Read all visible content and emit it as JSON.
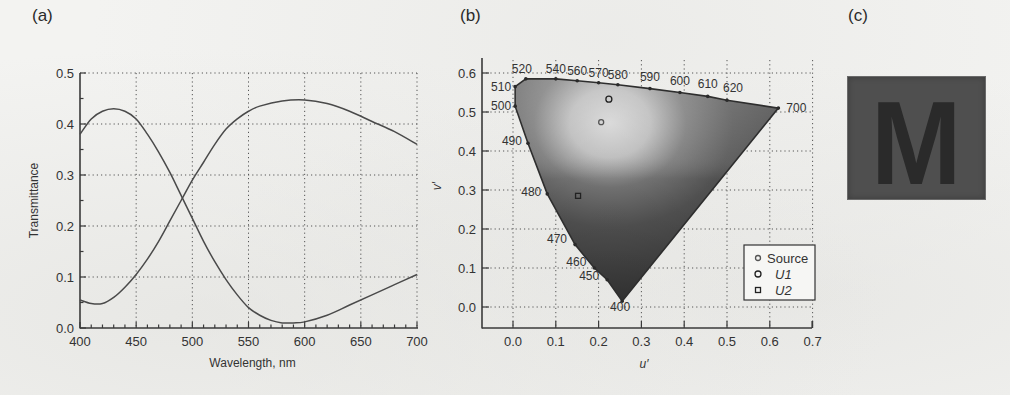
{
  "panels": {
    "a": {
      "label": "(a)"
    },
    "b": {
      "label": "(b)"
    },
    "c": {
      "label": "(c)",
      "letter": "M",
      "background_color": "#4f4f4f",
      "letter_color": "#2a2a2a"
    }
  },
  "chart_data": [
    {
      "id": "a",
      "type": "line",
      "title": "",
      "xlabel": "Wavelength, nm",
      "ylabel": "Transmittance",
      "xlim": [
        400,
        700
      ],
      "ylim": [
        0.0,
        0.5
      ],
      "xticks": [
        "400",
        "450",
        "500",
        "550",
        "600",
        "650",
        "700"
      ],
      "yticks": [
        "0.0",
        "0.1",
        "0.2",
        "0.3",
        "0.4",
        "0.5"
      ],
      "grid": true,
      "legend": null,
      "series": [
        {
          "name": "filter-1",
          "x": [
            400,
            410,
            420,
            430,
            440,
            450,
            460,
            470,
            480,
            490,
            500,
            510,
            520,
            530,
            540,
            550,
            560,
            570,
            580,
            590,
            600,
            620,
            640,
            660,
            680,
            700
          ],
          "values": [
            0.38,
            0.41,
            0.425,
            0.43,
            0.425,
            0.41,
            0.38,
            0.345,
            0.305,
            0.26,
            0.215,
            0.17,
            0.13,
            0.095,
            0.065,
            0.04,
            0.025,
            0.015,
            0.01,
            0.01,
            0.012,
            0.025,
            0.045,
            0.065,
            0.085,
            0.105
          ]
        },
        {
          "name": "filter-2",
          "x": [
            400,
            410,
            420,
            430,
            440,
            450,
            460,
            470,
            480,
            490,
            500,
            510,
            520,
            530,
            540,
            550,
            560,
            580,
            600,
            620,
            640,
            660,
            680,
            700
          ],
          "values": [
            0.055,
            0.048,
            0.048,
            0.06,
            0.08,
            0.105,
            0.135,
            0.17,
            0.21,
            0.25,
            0.29,
            0.325,
            0.36,
            0.39,
            0.41,
            0.425,
            0.435,
            0.445,
            0.447,
            0.44,
            0.425,
            0.405,
            0.385,
            0.36
          ]
        }
      ]
    },
    {
      "id": "b",
      "type": "scatter",
      "title": "",
      "xlabel": "u′",
      "ylabel": "v′",
      "xlim": [
        -0.07,
        0.7
      ],
      "ylim": [
        -0.055,
        0.6
      ],
      "xticks": [
        "0.0",
        "0.1",
        "0.2",
        "0.3",
        "0.4",
        "0.5",
        "0.6",
        "0.7"
      ],
      "yticks": [
        "0.0",
        "0.1",
        "0.2",
        "0.3",
        "0.4",
        "0.5",
        "0.6"
      ],
      "grid": true,
      "spectral_locus": [
        {
          "wl": "400",
          "u": 0.255,
          "v": 0.015
        },
        {
          "wl": "450",
          "u": 0.22,
          "v": 0.07
        },
        {
          "wl": "460",
          "u": 0.19,
          "v": 0.1
        },
        {
          "wl": "470",
          "u": 0.145,
          "v": 0.16
        },
        {
          "wl": "480",
          "u": 0.08,
          "v": 0.29
        },
        {
          "wl": "490",
          "u": 0.035,
          "v": 0.42
        },
        {
          "wl": "500",
          "u": 0.005,
          "v": 0.515
        },
        {
          "wl": "510",
          "u": 0.005,
          "v": 0.565
        },
        {
          "wl": "520",
          "u": 0.03,
          "v": 0.585
        },
        {
          "wl": "540",
          "u": 0.1,
          "v": 0.585
        },
        {
          "wl": "560",
          "u": 0.15,
          "v": 0.58
        },
        {
          "wl": "570",
          "u": 0.2,
          "v": 0.575
        },
        {
          "wl": "580",
          "u": 0.245,
          "v": 0.57
        },
        {
          "wl": "590",
          "u": 0.32,
          "v": 0.56
        },
        {
          "wl": "600",
          "u": 0.39,
          "v": 0.55
        },
        {
          "wl": "610",
          "u": 0.455,
          "v": 0.54
        },
        {
          "wl": "620",
          "u": 0.5,
          "v": 0.53
        },
        {
          "wl": "700",
          "u": 0.62,
          "v": 0.51
        }
      ],
      "series": [
        {
          "name": "Source",
          "marker": "circle-small",
          "x": [
            0.206
          ],
          "values": [
            0.474
          ]
        },
        {
          "name": "U1",
          "marker": "circle",
          "x": [
            0.224
          ],
          "values": [
            0.533
          ]
        },
        {
          "name": "U2",
          "marker": "square",
          "x": [
            0.152
          ],
          "values": [
            0.285
          ]
        }
      ],
      "legend": {
        "position": "lower right",
        "entries": [
          "Source",
          "U1",
          "U2"
        ]
      }
    }
  ]
}
